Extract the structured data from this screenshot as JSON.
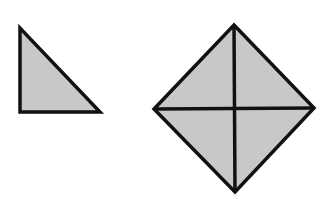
{
  "diagram": {
    "fill_color": "#c8c8c8",
    "stroke_color": "#111111",
    "shapes": [
      {
        "name": "right-triangle",
        "points": [
          [
            20,
            28
          ],
          [
            20,
            112
          ],
          [
            100,
            112
          ]
        ]
      },
      {
        "name": "diamond",
        "points": [
          [
            234,
            25
          ],
          [
            314,
            108
          ],
          [
            235,
            192
          ],
          [
            154,
            109
          ]
        ],
        "dividers": [
          [
            [
              234,
              25
            ],
            [
              235,
              192
            ]
          ],
          [
            [
              154,
              109
            ],
            [
              314,
              108
            ]
          ]
        ]
      }
    ]
  }
}
